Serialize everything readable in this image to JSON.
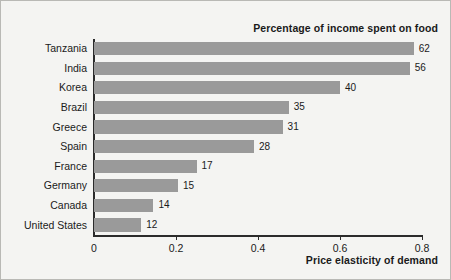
{
  "chart_data": {
    "type": "bar",
    "orientation": "horizontal",
    "title": "Percentage of income spent on food",
    "xlabel": "Price elasticity of demand",
    "ylabel": "",
    "xlim": [
      0,
      0.8
    ],
    "xticks": [
      "0",
      "0.2",
      "0.4",
      "0.6",
      "0.8"
    ],
    "xtick_values": [
      0,
      0.2,
      0.4,
      0.6,
      0.8
    ],
    "grid": false,
    "legend": "none",
    "bar_color": "#9a9a9a",
    "categories": [
      "Tanzania",
      "India",
      "Korea",
      "Brazil",
      "Greece",
      "Spain",
      "France",
      "Germany",
      "Canada",
      "United States"
    ],
    "values": [
      0.78,
      0.77,
      0.6,
      0.475,
      0.46,
      0.39,
      0.25,
      0.205,
      0.145,
      0.115
    ],
    "point_labels": [
      "62",
      "56",
      "40",
      "35",
      "31",
      "28",
      "17",
      "15",
      "14",
      "12"
    ],
    "label_meaning": "Percentage of income spent on food"
  }
}
